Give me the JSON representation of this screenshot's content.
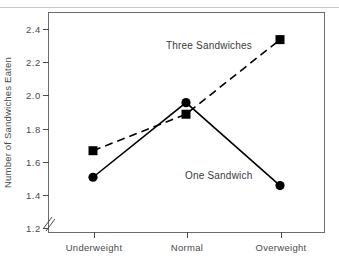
{
  "chart_data": {
    "type": "line",
    "title": "",
    "subtitle": "",
    "xlabel": "",
    "ylabel": "Number of Sandwiches Eaten",
    "categories": [
      "Underweight",
      "Normal",
      "Overweight"
    ],
    "yticks": [
      "2.4",
      "2.2",
      "2.0",
      "1.8",
      "1.6",
      "1.4",
      "1.2"
    ],
    "ytick_values": [
      2.4,
      2.2,
      2.0,
      1.8,
      1.6,
      1.4,
      1.2
    ],
    "ylim": [
      1.2,
      2.5
    ],
    "grid": false,
    "legend_position": "inline-annotations",
    "axis_break": {
      "axis": "y",
      "glyph": "//",
      "below_value": 1.2
    },
    "series": [
      {
        "name": "Three Sandwiches",
        "values": [
          1.66,
          1.88,
          2.33
        ],
        "line_style": "dashed",
        "marker": "square",
        "color": "#000000",
        "annotation": "Three Sandwiches"
      },
      {
        "name": "One Sandwich",
        "values": [
          1.5,
          1.95,
          1.45
        ],
        "line_style": "solid",
        "marker": "circle",
        "color": "#000000",
        "annotation": "One Sandwich"
      }
    ],
    "annotations": [
      {
        "text": "Three Sandwiches",
        "series": "Three Sandwiches"
      },
      {
        "text": "One Sandwich",
        "series": "One Sandwich"
      }
    ],
    "colors": {
      "line": "#000000",
      "frame": "#6b6b6b",
      "text": "#3a3a3a",
      "background": "#ffffff"
    }
  }
}
